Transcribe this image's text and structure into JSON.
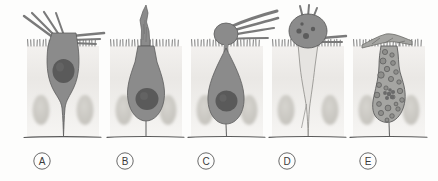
{
  "figure": {
    "background_color": "#fdfdfc",
    "panel_count": 5,
    "size": {
      "width": 438,
      "height": 181
    }
  },
  "colors": {
    "background": "#fdfdfc",
    "epithelium_block": "#eceae7",
    "neighbor_nucleus": "#c9c7c2",
    "cell_body_dark": "#8b8b8b",
    "cell_body_outline": "#5d5d5d",
    "cell_nucleus": "#5a5a5a",
    "cell_body_pale": "#e6e4e1",
    "pale_outline": "#8d8b88",
    "microvilli": "#6e6e6e",
    "basement_line": "#5a5a5a",
    "label_text": "#3a3a3a",
    "label_circle": "#6a6a6a",
    "vacuole_fill": "#a0a09c"
  },
  "panels": [
    {
      "id": "A",
      "label": "A",
      "label_x": 42,
      "label_y": 161,
      "center_x": 63,
      "description": "Columnar cell with dark cytoplasm, large round nucleus, apical tuft of long straight bristles projecting up and to the right above the brush border",
      "cell_state": "dark",
      "has_nucleus": true,
      "nucleus_shape": "round",
      "apical_feature": "straight-bristle-tuft",
      "vacuoles": 0
    },
    {
      "id": "B",
      "label": "B",
      "label_x": 125,
      "label_y": 161,
      "center_x": 146,
      "description": "Pear-shaped dark cell with a tall narrow jagged flame-like protrusion rising vertically from the apical surface",
      "cell_state": "dark",
      "has_nucleus": true,
      "nucleus_shape": "round",
      "apical_feature": "vertical-jagged-spike",
      "vacuoles": 0
    },
    {
      "id": "C",
      "label": "C",
      "label_x": 206,
      "label_y": 161,
      "center_x": 227,
      "description": "Teardrop dark cell narrowing to a thin apical neck, topped by a rounded bulb with swept-back streamers trailing to the right",
      "cell_state": "dark",
      "has_nucleus": true,
      "nucleus_shape": "round",
      "apical_feature": "bulb-with-swept-streamers",
      "vacuoles": 0
    },
    {
      "id": "D",
      "label": "D",
      "label_x": 287,
      "label_y": 161,
      "center_x": 308,
      "description": "Dark round condensed apical body with small dark granules and short antennae above the surface; pale thin residual cell body tapering below",
      "cell_state": "pale-body-dark-head",
      "has_nucleus": false,
      "nucleus_shape": "granules",
      "apical_feature": "round-condensed-head",
      "vacuoles": 0
    },
    {
      "id": "E",
      "label": "E",
      "label_x": 368,
      "label_y": 161,
      "center_x": 389,
      "description": "Heavily vacuolated irregular grey cell filled with many circular vacuoles, fragmenting rosette nucleus, and a flattened splayed apical cap",
      "cell_state": "vacuolated",
      "has_nucleus": true,
      "nucleus_shape": "fragmented-rosette",
      "apical_feature": "flattened-splayed-cap",
      "vacuoles": 22
    }
  ],
  "anatomy": {
    "apical_surface_y": 46,
    "basement_membrane_y": 137,
    "microvilli_label": "brush-border-microvilli",
    "neighbor_cell_label": "adjacent-epithelial-cell"
  }
}
